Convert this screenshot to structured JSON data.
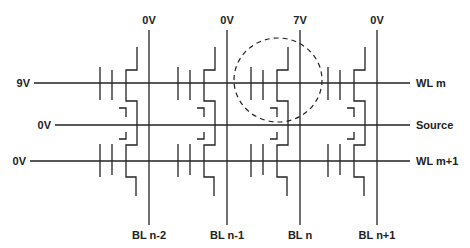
{
  "diagram": {
    "colors": {
      "line": "#222222",
      "background": "#ffffff"
    },
    "word_lines": [
      {
        "id": "wl-m",
        "label": "WL m",
        "voltage": "9V",
        "y": 83,
        "x_start": 34,
        "voltage_x": 30
      },
      {
        "id": "source",
        "label": "Source",
        "voltage": "0V",
        "y": 125,
        "x_start": 55,
        "voltage_x": 51
      },
      {
        "id": "wl-m1",
        "label": "WL m+1",
        "voltage": "0V",
        "y": 161,
        "x_start": 30,
        "voltage_x": 26
      }
    ],
    "bit_lines": [
      {
        "id": "bl-n-2",
        "label": "BL n-2",
        "voltage": "0V",
        "x": 149
      },
      {
        "id": "bl-n-1",
        "label": "BL n-1",
        "voltage": "0V",
        "x": 227
      },
      {
        "id": "bl-n",
        "label": "BL n",
        "voltage": "7V",
        "x": 300
      },
      {
        "id": "bl-n1",
        "label": "BL n+1",
        "voltage": "0V",
        "x": 377
      }
    ],
    "selected_cell": {
      "bit_line": "BL n",
      "word_line": "WL m",
      "cx": 278,
      "cy": 80,
      "rx": 44,
      "ry": 42
    }
  }
}
